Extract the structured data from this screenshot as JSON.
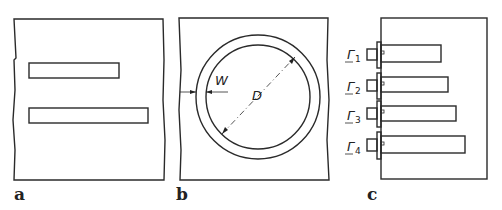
{
  "figure": {
    "panels": [
      {
        "id": "a",
        "label": "a",
        "description": "Two rectangular slots (short and long) in a plate"
      },
      {
        "id": "b",
        "label": "b",
        "description": "Annular ring slot",
        "dimensions": {
          "width_label": "W",
          "diameter_label": "D"
        }
      },
      {
        "id": "c",
        "label": "c",
        "description": "Four fed rectangular slots of increasing length",
        "ports": [
          {
            "symbol": "Γ",
            "index": "1"
          },
          {
            "symbol": "Γ",
            "index": "2"
          },
          {
            "symbol": "Γ",
            "index": "3"
          },
          {
            "symbol": "Γ",
            "index": "4"
          }
        ]
      }
    ]
  }
}
